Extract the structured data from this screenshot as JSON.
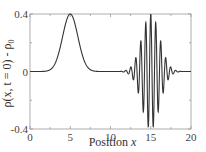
{
  "chart_data": {
    "type": "line",
    "title": "",
    "xlabel": "Position x",
    "xlabel_parts": {
      "text": "Position ",
      "var": "x"
    },
    "ylabel": "ρ(x, t = 0) - ρ0",
    "ylabel_parts": {
      "main": "ρ(x, t = 0) - ρ",
      "sub": "0"
    },
    "xlim": [
      0,
      20
    ],
    "ylim": [
      -0.4,
      0.4
    ],
    "xticks": [
      0,
      5,
      10,
      15,
      20
    ],
    "xtick_labels": [
      "0",
      "5",
      "10",
      "15",
      "20"
    ],
    "xminor_ticks": [
      2.5,
      7.5,
      12.5,
      17.5
    ],
    "yticks": [
      -0.4,
      0,
      0.4
    ],
    "ytick_labels": [
      "-0.4",
      "0",
      "0.4"
    ],
    "yminor_ticks": [
      -0.2,
      0.2
    ],
    "grid": false,
    "legend": null,
    "series": [
      {
        "name": "ρ(x, t=0) - ρ0",
        "color": "#333333",
        "components": [
          {
            "kind": "gaussian",
            "center": 5.0,
            "amplitude": 0.4,
            "sigma": 0.95
          },
          {
            "kind": "gaussian-modulated-cosine",
            "center": 15.0,
            "amplitude": 0.4,
            "sigma": 1.1,
            "wavelength": 0.62
          }
        ],
        "sample_points": [
          {
            "x": 0,
            "y": 0
          },
          {
            "x": 2.5,
            "y": 0.01
          },
          {
            "x": 3.5,
            "y": 0.12
          },
          {
            "x": 4.3,
            "y": 0.31
          },
          {
            "x": 5.0,
            "y": 0.4
          },
          {
            "x": 5.7,
            "y": 0.31
          },
          {
            "x": 6.5,
            "y": 0.12
          },
          {
            "x": 7.5,
            "y": 0.01
          },
          {
            "x": 10,
            "y": 0
          },
          {
            "x": 12,
            "y": 0
          },
          {
            "x": 13.0,
            "y": -0.05
          },
          {
            "x": 14.1,
            "y": 0.2
          },
          {
            "x": 14.7,
            "y": 0.33
          },
          {
            "x": 15.0,
            "y": 0.4
          },
          {
            "x": 15.3,
            "y": -0.38
          },
          {
            "x": 15.9,
            "y": -0.3
          },
          {
            "x": 17.0,
            "y": 0.04
          },
          {
            "x": 18,
            "y": 0
          },
          {
            "x": 20,
            "y": 0
          }
        ]
      }
    ],
    "plot_area_px": {
      "left": 30,
      "top": 14,
      "right": 191,
      "bottom": 129
    }
  }
}
